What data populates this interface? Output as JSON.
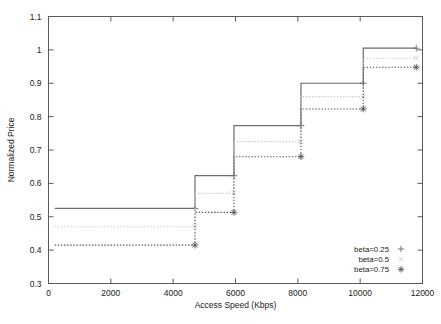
{
  "chart_data": {
    "type": "line",
    "subtype": "step",
    "title": "",
    "xlabel": "Access Speed (Kbps)",
    "ylabel": "Normalized Price",
    "xlim": [
      0,
      12000
    ],
    "ylim": [
      0.3,
      1.1
    ],
    "xticks": [
      0,
      2000,
      4000,
      6000,
      8000,
      10000,
      12000
    ],
    "xtick_labels": [
      "0",
      "2000",
      "4000",
      "6000",
      "8000",
      "10000",
      "12000"
    ],
    "yticks": [
      0.3,
      0.4,
      0.5,
      0.6,
      0.7,
      0.8,
      0.9,
      1.0,
      1.1
    ],
    "ytick_labels": [
      "0.3",
      "0.4",
      "0.5",
      "0.6",
      "0.7",
      "0.8",
      "0.9",
      "1",
      "1.1"
    ],
    "grid": false,
    "legend_position": "bottom-right",
    "step_edges": [
      200,
      4700,
      5950,
      8100,
      10100,
      11800
    ],
    "series": [
      {
        "name": "beta=0.25",
        "marker": "plus",
        "linestyle": "solid",
        "color": "#6b6b6b",
        "values": [
          0.525,
          0.623,
          0.773,
          0.9,
          1.005
        ],
        "points": [
          {
            "x": 4700,
            "y": 0.525
          },
          {
            "x": 5950,
            "y": 0.623
          },
          {
            "x": 8100,
            "y": 0.773
          },
          {
            "x": 10100,
            "y": 0.9
          },
          {
            "x": 11800,
            "y": 1.005
          }
        ]
      },
      {
        "name": "beta=0.5",
        "marker": "cross",
        "linestyle": "dotted",
        "color": "#c9c9c9",
        "values": [
          0.47,
          0.57,
          0.725,
          0.86,
          0.975
        ],
        "points": [
          {
            "x": 4700,
            "y": 0.47
          },
          {
            "x": 5950,
            "y": 0.57
          },
          {
            "x": 8100,
            "y": 0.725
          },
          {
            "x": 10100,
            "y": 0.86
          },
          {
            "x": 11800,
            "y": 0.975
          }
        ]
      },
      {
        "name": "beta=0.75",
        "marker": "star",
        "linestyle": "dotted",
        "color": "#555555",
        "values": [
          0.415,
          0.513,
          0.68,
          0.823,
          0.948
        ],
        "points": [
          {
            "x": 4700,
            "y": 0.415
          },
          {
            "x": 5950,
            "y": 0.513
          },
          {
            "x": 8100,
            "y": 0.68
          },
          {
            "x": 10100,
            "y": 0.823
          },
          {
            "x": 11800,
            "y": 0.948
          }
        ]
      }
    ]
  },
  "legend": {
    "entries": [
      {
        "label": "beta=0.25"
      },
      {
        "label": "beta=0.5"
      },
      {
        "label": "beta=0.75"
      }
    ]
  }
}
